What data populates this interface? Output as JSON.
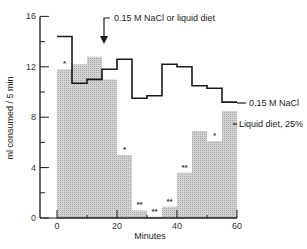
{
  "chart_data": {
    "type": "bar",
    "title": "",
    "xlabel": "Minutes",
    "ylabel": "ml consumed / 5 min",
    "xlim": [
      0,
      60
    ],
    "ylim": [
      0,
      16
    ],
    "x_ticks": [
      0,
      20,
      40,
      60
    ],
    "y_ticks": [
      0,
      4,
      8,
      12,
      16
    ],
    "grid": false,
    "bin_width_min": 5,
    "categories": [
      "0-5",
      "5-10",
      "10-15",
      "15-20",
      "20-25",
      "25-30",
      "30-35",
      "35-40",
      "40-45",
      "45-50",
      "50-55",
      "55-60"
    ],
    "series": [
      {
        "name": "Liquid diet, 25%",
        "style": "shaded bars",
        "values": [
          11.8,
          12.2,
          12.8,
          11.0,
          5.0,
          0.6,
          0.1,
          0.9,
          3.6,
          6.9,
          6.1,
          8.5
        ],
        "significance": [
          "*",
          "",
          "",
          "",
          "*",
          "**",
          "**",
          "**",
          "**",
          "",
          "*",
          ""
        ]
      },
      {
        "name": "0.15 M NaCl",
        "style": "step line",
        "values": [
          14.4,
          10.7,
          11.0,
          11.8,
          12.6,
          9.5,
          9.7,
          12.2,
          12.0,
          10.5,
          10.3,
          9.2
        ]
      }
    ],
    "annotations": [
      {
        "text": "0.15 M NaCl or liquid diet",
        "type": "arrow",
        "x_min": 15
      },
      {
        "text": "0.15 M NaCl",
        "type": "series-label"
      },
      {
        "text": "Liquid diet, 25%",
        "type": "series-label"
      }
    ],
    "legend_position": "inline-right"
  },
  "labels": {
    "xlabel": "Minutes",
    "ylabel": "ml consumed / 5 min",
    "arrow_note": "0.15 M NaCl or liquid diet",
    "nacl_label": "0.15 M NaCl",
    "diet_label": "Liquid diet, 25%"
  },
  "colors": {
    "bar_fill": "#c8c8c8",
    "line": "#1a1a1a",
    "axis": "#1a1a1a"
  }
}
